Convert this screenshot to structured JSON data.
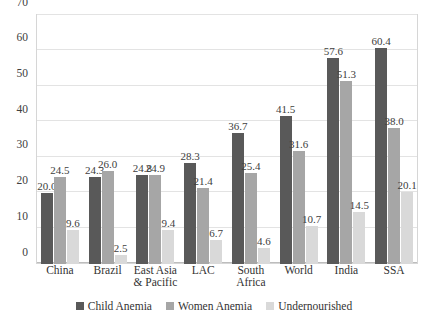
{
  "chart_data": {
    "type": "bar",
    "title": "",
    "subtitle": "",
    "xlabel": "",
    "ylabel": "",
    "ylim": [
      0,
      70
    ],
    "yticks": [
      0,
      10,
      20,
      30,
      40,
      50,
      60,
      70
    ],
    "grid": true,
    "legend_position": "bottom",
    "categories": [
      "China",
      "Brazil",
      "East Asia & Pacific",
      "LAC",
      "South Africa",
      "World",
      "India",
      "SSA"
    ],
    "category_lines": [
      [
        "China"
      ],
      [
        "Brazil"
      ],
      [
        "East Asia",
        "& Pacific"
      ],
      [
        "LAC"
      ],
      [
        "South",
        "Africa"
      ],
      [
        "World"
      ],
      [
        "India"
      ],
      [
        "SSA"
      ]
    ],
    "series": [
      {
        "name": "Child Anemia",
        "color": "#595959",
        "values": [
          20.0,
          24.3,
          24.8,
          28.3,
          36.7,
          41.5,
          57.6,
          60.4
        ],
        "labels": [
          "20.0",
          "24.3",
          "24.8",
          "28.3",
          "36.7",
          "41.5",
          "57.6",
          "60.4"
        ]
      },
      {
        "name": "Women Anemia",
        "color": "#a6a6a6",
        "values": [
          24.5,
          26.0,
          24.9,
          21.4,
          25.4,
          31.6,
          51.3,
          38.0
        ],
        "labels": [
          "24.5",
          "26.0",
          "24.9",
          "21.4",
          "25.4",
          "31.6",
          "51.3",
          "38.0"
        ]
      },
      {
        "name": "Undernourished",
        "color": "#d9d9d9",
        "values": [
          9.6,
          2.5,
          9.4,
          6.7,
          4.6,
          10.7,
          14.5,
          20.1
        ],
        "labels": [
          "9.6",
          "2.5",
          "9.4",
          "6.7",
          "4.6",
          "10.7",
          "14.5",
          "20.1"
        ]
      }
    ]
  }
}
